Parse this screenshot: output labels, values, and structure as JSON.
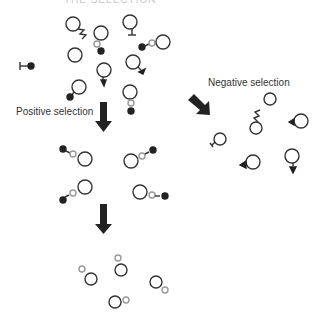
{
  "diagram": {
    "title_partial": "THE SELECTION",
    "labels": {
      "positive": "Positive selection",
      "negative": "Negative selection"
    },
    "colors": {
      "stroke": "#333333",
      "fill_dark": "#222222",
      "hollow_small": "#888888",
      "text": "#333333",
      "background": "#ffffff"
    },
    "stages": [
      {
        "name": "initial-population",
        "description": "Mixed cells with various receptors"
      },
      {
        "name": "after-positive-selection",
        "description": "Cells bound via hollow linker to dark ligand"
      },
      {
        "name": "final-population",
        "description": "Cells with small hollow partner only"
      },
      {
        "name": "negative-selection-rejects",
        "description": "Cells with mismatched receptors"
      }
    ]
  }
}
